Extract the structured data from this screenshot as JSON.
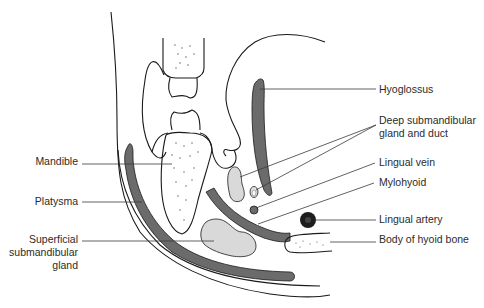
{
  "colors": {
    "muscle": "#6b6b6b",
    "gland": "#d9d9d9",
    "bone": "#ffffff",
    "artery": "#1e1e1e",
    "line": "#1a1a1a",
    "text": "#2b2b2b"
  },
  "labels": {
    "hyoglossus": "Hyoglossus",
    "deep_gland_1": "Deep submandibular",
    "deep_gland_2": "gland and duct",
    "lingual_vein": "Lingual vein",
    "mylohyoid": "Mylohyoid",
    "lingual_artery": "Lingual artery",
    "hyoid": "Body of hyoid bone",
    "mandible": "Mandible",
    "platysma": "Platysma",
    "superficial_1": "Superficial",
    "superficial_2": "submandibular",
    "superficial_3": "gland"
  }
}
